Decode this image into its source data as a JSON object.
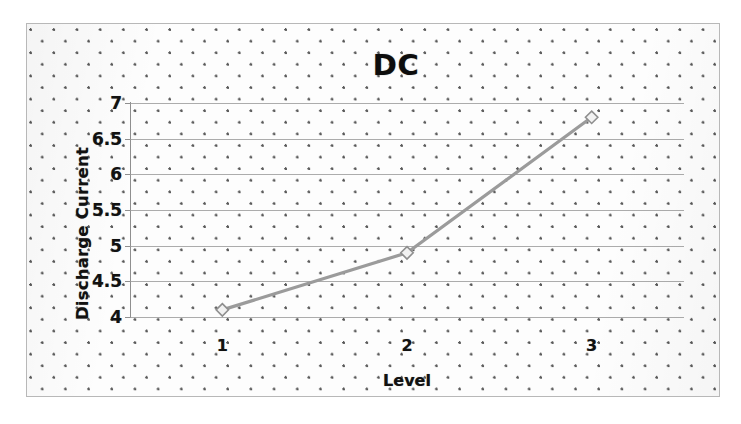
{
  "chart_data": {
    "type": "line",
    "title": "DC",
    "xlabel": "Level",
    "ylabel": "Discharge Current",
    "categories": [
      "1",
      "2",
      "3"
    ],
    "x": [
      1,
      2,
      3
    ],
    "values": [
      4.1,
      4.9,
      6.8
    ],
    "series": [
      {
        "name": "Discharge Current",
        "values": [
          4.1,
          4.9,
          6.8
        ],
        "line_color": "#9b9b9b",
        "marker": "diamond",
        "marker_fill": "#f2f2f2",
        "marker_stroke": "#8f8f8f"
      }
    ],
    "ylim": [
      4,
      7
    ],
    "xlim": [
      0.5,
      3.5
    ],
    "ytick_labels": [
      "7",
      "6.5",
      "6",
      "5.5",
      "5",
      "4.5",
      "4"
    ],
    "ytick_values": [
      7,
      6.5,
      6,
      5.5,
      5,
      4.5,
      4
    ],
    "xtick_labels": [
      "1",
      "2",
      "3"
    ],
    "grid": "horizontal",
    "legend": "none",
    "background": "dotted-halftone",
    "frame_border_color": "#b8b8b8",
    "gridline_color": "#9a9a9a",
    "text_color": "#111111"
  }
}
